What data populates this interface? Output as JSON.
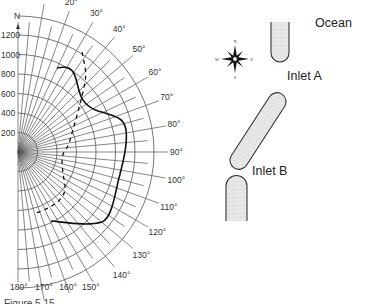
{
  "polar_plot": {
    "north_label": "N",
    "radial_ticks": [
      "200",
      "400",
      "600",
      "800",
      "1000",
      "1200"
    ],
    "angle_labels": [
      "10°",
      "20°",
      "30°",
      "40°",
      "50°",
      "60°",
      "70°",
      "80°",
      "90°",
      "100°",
      "110°",
      "120°",
      "130°",
      "140°",
      "150°",
      "160°",
      "170°",
      "180°"
    ],
    "series": [
      {
        "name": "solid-curve",
        "style": "solid"
      },
      {
        "name": "dashed-curve",
        "style": "dashed"
      }
    ]
  },
  "map": {
    "compass": {
      "n": "N",
      "s": "S",
      "e": "E",
      "w": "W"
    },
    "ocean_label": "Ocean",
    "inlet_a_label": "Inlet A",
    "inlet_b_label": "Inlet B"
  },
  "caption": "Figure 5.15 ..."
}
